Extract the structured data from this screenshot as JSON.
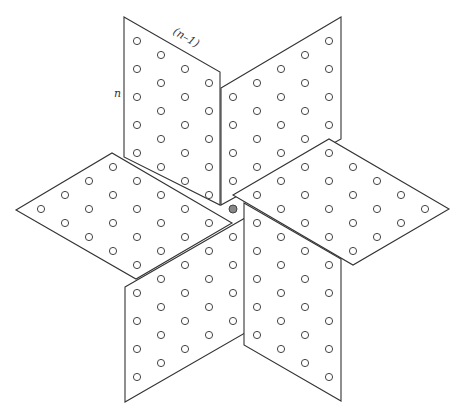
{
  "figure": {
    "width": 463,
    "height": 416,
    "stroke_color": "#333333",
    "dot_stroke": "#444444",
    "dot_fill": "#ffffff",
    "dot_radius": 3.6,
    "labels": {
      "side_n": "n",
      "side_n_minus_1": "(n–1)"
    },
    "center_dot": {
      "x": 233,
      "y": 209,
      "fill": "#888888"
    },
    "parallelograms": [
      {
        "name": "top-left",
        "points": [
          [
            124,
            17
          ],
          [
            220,
            72
          ],
          [
            220,
            205
          ],
          [
            124,
            157
          ]
        ],
        "dots": [
          [
            137,
            41
          ],
          [
            137,
            69
          ],
          [
            137,
            97
          ],
          [
            137,
            125
          ],
          [
            137,
            153
          ],
          [
            161,
            55
          ],
          [
            161,
            83
          ],
          [
            161,
            111
          ],
          [
            161,
            139
          ],
          [
            161,
            167
          ],
          [
            185,
            69
          ],
          [
            185,
            97
          ],
          [
            185,
            125
          ],
          [
            185,
            153
          ],
          [
            185,
            181
          ],
          [
            209,
            83
          ],
          [
            209,
            111
          ],
          [
            209,
            139
          ],
          [
            209,
            167
          ],
          [
            209,
            195
          ]
        ]
      },
      {
        "name": "top-right",
        "points": [
          [
            221,
            88
          ],
          [
            341,
            17
          ],
          [
            341,
            139
          ],
          [
            221,
            205
          ]
        ],
        "dots": [
          [
            233,
            97
          ],
          [
            233,
            125
          ],
          [
            233,
            153
          ],
          [
            233,
            181
          ],
          [
            257,
            83
          ],
          [
            257,
            111
          ],
          [
            257,
            139
          ],
          [
            257,
            167
          ],
          [
            281,
            69
          ],
          [
            281,
            97
          ],
          [
            281,
            125
          ],
          [
            281,
            153
          ],
          [
            305,
            55
          ],
          [
            305,
            83
          ],
          [
            305,
            111
          ],
          [
            305,
            139
          ],
          [
            329,
            41
          ],
          [
            329,
            69
          ],
          [
            329,
            97
          ],
          [
            329,
            125
          ]
        ]
      },
      {
        "name": "right",
        "points": [
          [
            233,
            195
          ],
          [
            329,
            139
          ],
          [
            449,
            209
          ],
          [
            353,
            265
          ]
        ],
        "dots": [
          [
            257,
            195
          ],
          [
            281,
            181
          ],
          [
            281,
            209
          ],
          [
            305,
            167
          ],
          [
            305,
            195
          ],
          [
            305,
            223
          ],
          [
            329,
            153
          ],
          [
            329,
            181
          ],
          [
            329,
            209
          ],
          [
            329,
            237
          ],
          [
            353,
            167
          ],
          [
            353,
            195
          ],
          [
            353,
            223
          ],
          [
            353,
            251
          ],
          [
            377,
            181
          ],
          [
            377,
            209
          ],
          [
            377,
            237
          ],
          [
            401,
            195
          ],
          [
            401,
            223
          ],
          [
            425,
            209
          ]
        ]
      },
      {
        "name": "left",
        "points": [
          [
            16,
            210
          ],
          [
            112,
            153
          ],
          [
            232,
            223
          ],
          [
            136,
            279
          ]
        ],
        "dots": [
          [
            41,
            209
          ],
          [
            65,
            195
          ],
          [
            65,
            223
          ],
          [
            89,
            181
          ],
          [
            89,
            209
          ],
          [
            89,
            237
          ],
          [
            113,
            167
          ],
          [
            113,
            195
          ],
          [
            113,
            223
          ],
          [
            113,
            251
          ],
          [
            137,
            181
          ],
          [
            137,
            209
          ],
          [
            137,
            237
          ],
          [
            137,
            265
          ],
          [
            161,
            195
          ],
          [
            161,
            223
          ],
          [
            161,
            251
          ],
          [
            185,
            209
          ],
          [
            185,
            237
          ],
          [
            209,
            223
          ]
        ]
      },
      {
        "name": "bottom-left",
        "points": [
          [
            125,
            287
          ],
          [
            245,
            218
          ],
          [
            245,
            333
          ],
          [
            125,
            402
          ]
        ],
        "dots": [
          [
            137,
            293
          ],
          [
            137,
            321
          ],
          [
            137,
            349
          ],
          [
            137,
            377
          ],
          [
            161,
            279
          ],
          [
            161,
            307
          ],
          [
            161,
            335
          ],
          [
            161,
            363
          ],
          [
            185,
            265
          ],
          [
            185,
            293
          ],
          [
            185,
            321
          ],
          [
            185,
            349
          ],
          [
            209,
            251
          ],
          [
            209,
            279
          ],
          [
            209,
            307
          ],
          [
            209,
            335
          ],
          [
            233,
            237
          ],
          [
            233,
            265
          ],
          [
            233,
            293
          ],
          [
            233,
            321
          ]
        ]
      },
      {
        "name": "bottom-right",
        "points": [
          [
            244,
            203
          ],
          [
            341,
            259
          ],
          [
            341,
            401
          ],
          [
            244,
            345
          ]
        ],
        "dots": [
          [
            257,
            223
          ],
          [
            257,
            251
          ],
          [
            257,
            279
          ],
          [
            257,
            307
          ],
          [
            257,
            335
          ],
          [
            281,
            237
          ],
          [
            281,
            265
          ],
          [
            281,
            293
          ],
          [
            281,
            321
          ],
          [
            281,
            349
          ],
          [
            305,
            251
          ],
          [
            305,
            279
          ],
          [
            305,
            307
          ],
          [
            305,
            335
          ],
          [
            305,
            363
          ],
          [
            329,
            265
          ],
          [
            329,
            293
          ],
          [
            329,
            321
          ],
          [
            329,
            349
          ],
          [
            329,
            377
          ]
        ]
      }
    ]
  }
}
